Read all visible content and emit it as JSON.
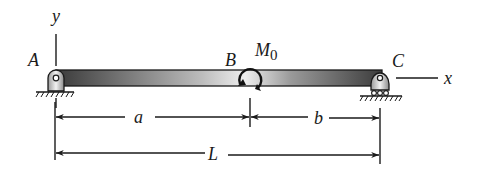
{
  "diagram": {
    "type": "simply-supported-beam",
    "labels": {
      "y_axis": "y",
      "x_axis": "x",
      "point_a": "A",
      "point_b": "B",
      "point_c": "C",
      "moment": "M",
      "moment_subscript": "0"
    },
    "dimensions": {
      "segment_a": "a",
      "segment_b": "b",
      "total_length": "L"
    },
    "supports": {
      "left": "pin",
      "right": "roller"
    },
    "colors": {
      "beam_dark": "#3a3a3a",
      "beam_light": "#e6e6e6",
      "ink": "#1a1a1a"
    }
  }
}
